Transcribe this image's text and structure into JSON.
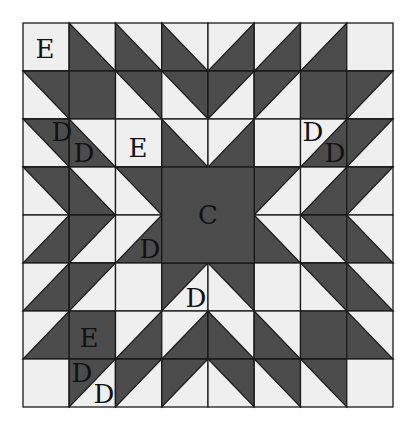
{
  "diagram": {
    "type": "quilt-block",
    "grid": {
      "rows": 8,
      "cols": 8,
      "x0": 23,
      "y0": 23,
      "width": 370,
      "height": 384
    },
    "colors": {
      "dark": "#4c4c4c",
      "light": "#efefef",
      "line": "#1a1a1a",
      "label": "#111111"
    },
    "cell_legend": {
      "L": "light square",
      "F": "dark square",
      "LL": "dark lower-left triangle (diagonal top-left to bottom-right)",
      "UR": "dark upper-right triangle (diagonal top-left to bottom-right)",
      "LR": "dark lower-right triangle (diagonal bottom-left to top-right)",
      "UL": "dark upper-left triangle (diagonal bottom-left to top-right)",
      "C": "part of merged center dark square"
    },
    "cells": [
      [
        "L",
        "LL",
        "LL",
        "LL",
        "LR",
        "LR",
        "LR",
        "L"
      ],
      [
        "UR",
        "F",
        "UR",
        "UR",
        "UL",
        "UL",
        "F",
        "UL"
      ],
      [
        "UR",
        "LL",
        "L",
        "LL",
        "LR",
        "L",
        "LR",
        "UL"
      ],
      [
        "UR",
        "LL",
        "UR",
        "C",
        "C",
        "UL",
        "LR",
        "UL"
      ],
      [
        "LR",
        "UL",
        "LR",
        "C",
        "C",
        "LL",
        "UR",
        "LL"
      ],
      [
        "LR",
        "UL",
        "L",
        "UL",
        "UR",
        "L",
        "UR",
        "LL"
      ],
      [
        "LR",
        "F",
        "LR",
        "LR",
        "LL",
        "LL",
        "F",
        "LL"
      ],
      [
        "L",
        "UL",
        "UL",
        "UL",
        "UR",
        "UR",
        "UR",
        "L"
      ]
    ],
    "center_block": {
      "label": "C",
      "row": 3,
      "col": 3,
      "rowspan": 2,
      "colspan": 2
    },
    "labels": [
      {
        "text": "E",
        "x": 45,
        "y": 58
      },
      {
        "text": "D",
        "x": 62,
        "y": 141
      },
      {
        "text": "D",
        "x": 84,
        "y": 162
      },
      {
        "text": "E",
        "x": 138,
        "y": 157
      },
      {
        "text": "D",
        "x": 313,
        "y": 141
      },
      {
        "text": "D",
        "x": 335,
        "y": 162
      },
      {
        "text": "C",
        "x": 208,
        "y": 224
      },
      {
        "text": "D",
        "x": 150,
        "y": 258
      },
      {
        "text": "D",
        "x": 196,
        "y": 307
      },
      {
        "text": "E",
        "x": 89,
        "y": 347
      },
      {
        "text": "D",
        "x": 82,
        "y": 382
      },
      {
        "text": "D",
        "x": 104,
        "y": 403
      }
    ]
  }
}
